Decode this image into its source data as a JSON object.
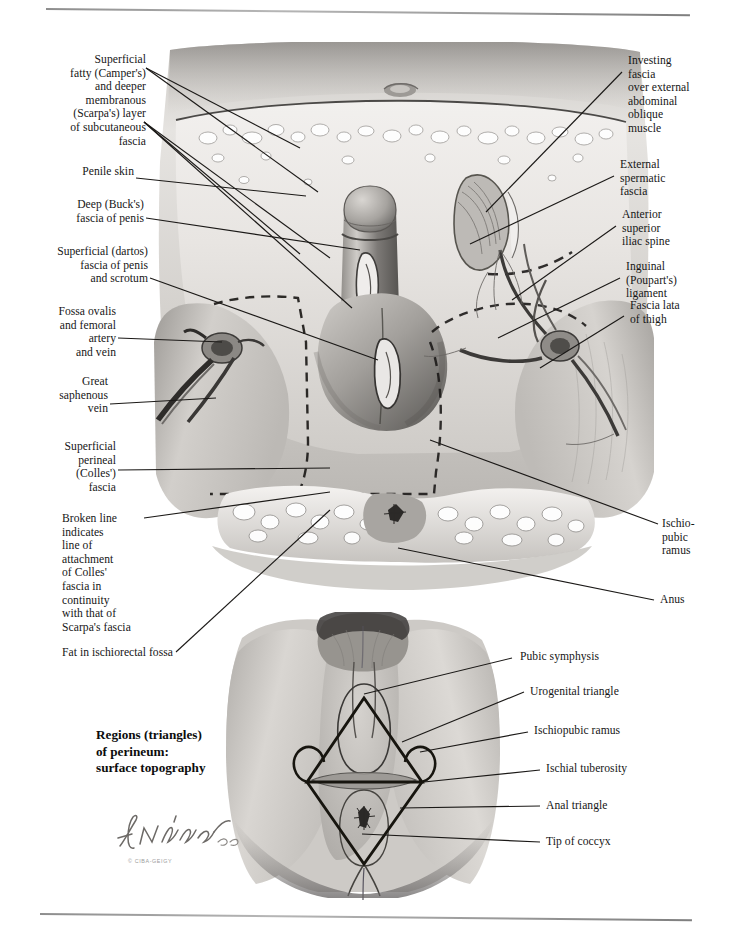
{
  "plate": {
    "title_block": "Regions (triangles)\nof perineum:\nsurface topography",
    "signature_name": "F. Netter",
    "signature_copyright": "© CIBA-GEIGY"
  },
  "labels_left": [
    {
      "id": "camper-scarpa",
      "text": "Superficial\nfatty (Camper's)\nand deeper\nmembranous\n(Scarpa's) layer\nof subcutaneous\nfascia"
    },
    {
      "id": "penile-skin",
      "text": "Penile skin"
    },
    {
      "id": "bucks-fascia",
      "text": "Deep (Buck's)\nfascia of penis"
    },
    {
      "id": "dartos-fascia",
      "text": "Superficial (dartos)\nfascia of penis\nand scrotum"
    },
    {
      "id": "fossa-ovalis",
      "text": "Fossa ovalis\nand femoral\nartery\nand vein"
    },
    {
      "id": "great-saphenous-vein",
      "text": "Great\nsaphenous\nvein"
    },
    {
      "id": "colles-fascia",
      "text": "Superficial\nperineal\n(Colles')\nfascia"
    },
    {
      "id": "broken-line",
      "text": "Broken line\nindicates\nline of\nattachment\nof Colles'\nfascia in\ncontinuity\nwith that of\nScarpa's fascia"
    },
    {
      "id": "ischiorectal-fat",
      "text": "Fat in ischiorectal fossa"
    }
  ],
  "labels_right": [
    {
      "id": "investing-fascia",
      "text": "Investing\nfascia\nover external\nabdominal\noblique\nmuscle"
    },
    {
      "id": "external-spermatic-fascia",
      "text": "External\nspermatic\nfascia"
    },
    {
      "id": "asis",
      "text": "Anterior\nsuperior\niliac spine"
    },
    {
      "id": "inguinal-ligament",
      "text": "Inguinal\n(Poupart's)\nligament"
    },
    {
      "id": "fascia-lata",
      "text": "Fascia lata\nof thigh"
    },
    {
      "id": "ischiopubic-ramus",
      "text": "Ischio-\npubic\nramus"
    },
    {
      "id": "anus",
      "text": "Anus"
    }
  ],
  "labels_lower": [
    {
      "id": "pubic-symphysis",
      "text": "Pubic symphysis"
    },
    {
      "id": "urogenital-triangle",
      "text": "Urogenital triangle"
    },
    {
      "id": "ischiopubic-ramus-lower",
      "text": "Ischiopubic ramus"
    },
    {
      "id": "ischial-tuberosity",
      "text": "Ischial tuberosity"
    },
    {
      "id": "anal-triangle",
      "text": "Anal triangle"
    },
    {
      "id": "tip-of-coccyx",
      "text": "Tip of coccyx"
    }
  ],
  "colors": {
    "ink": "#161616",
    "rule": "#8d8d8d",
    "art_light": "#e2e0dd",
    "art_mid": "#b9b6b2",
    "art_dark": "#6e6b68",
    "art_deep": "#3a3836"
  }
}
